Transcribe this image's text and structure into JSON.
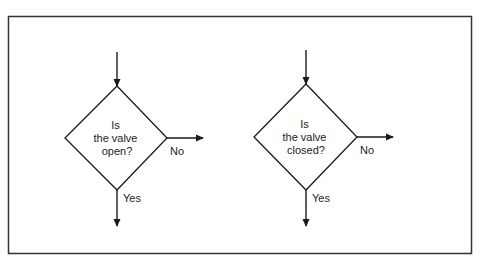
{
  "diagram": {
    "frame_color": "#333333",
    "stroke_color": "#1a1a1a",
    "decisions": [
      {
        "id": "decision-open",
        "question_lines": [
          "Is",
          "the valve",
          "open?"
        ],
        "no_label": "No",
        "yes_label": "Yes"
      },
      {
        "id": "decision-closed",
        "question_lines": [
          "Is",
          "the valve",
          "closed?"
        ],
        "no_label": "No",
        "yes_label": "Yes"
      }
    ]
  }
}
